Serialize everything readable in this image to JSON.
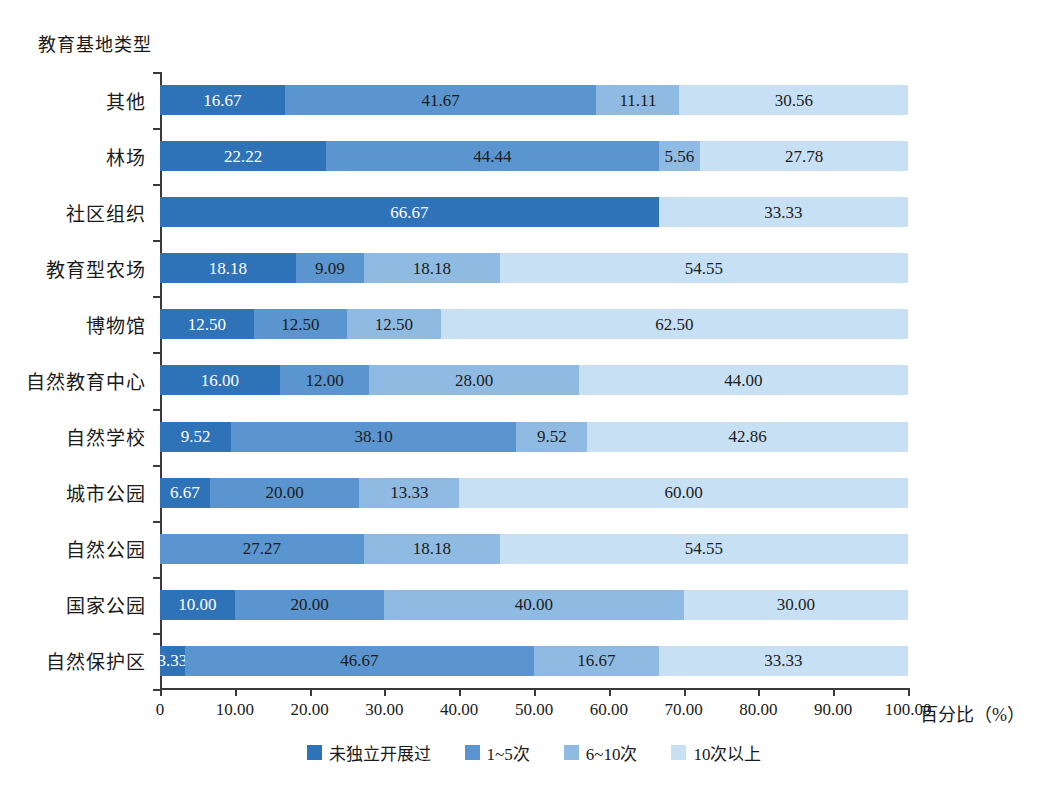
{
  "chart_data": {
    "type": "bar",
    "orientation": "horizontal",
    "stacked": true,
    "normalized": true,
    "title": "",
    "ylabel": "教育基地类型",
    "xlabel": "百分比（%）",
    "xlim": [
      0,
      100
    ],
    "xticks": [
      "0",
      "10.00",
      "20.00",
      "30.00",
      "40.00",
      "50.00",
      "60.00",
      "70.00",
      "80.00",
      "90.00",
      "100.00"
    ],
    "xtick_values": [
      0,
      10,
      20,
      30,
      40,
      50,
      60,
      70,
      80,
      90,
      100
    ],
    "grid": false,
    "legend_position": "bottom",
    "categories": [
      "其他",
      "林场",
      "社区组织",
      "教育型农场",
      "博物馆",
      "自然教育中心",
      "自然学校",
      "城市公园",
      "自然公园",
      "国家公园",
      "自然保护区"
    ],
    "series": [
      {
        "name": "未独立开展过",
        "color": "#2e72b8",
        "values": [
          16.67,
          22.22,
          66.67,
          18.18,
          12.5,
          16.0,
          9.52,
          6.67,
          0,
          10.0,
          3.33
        ],
        "labels": [
          "16.67",
          "22.22",
          "66.67",
          "18.18",
          "12.50",
          "16.00",
          "9.52",
          "6.67",
          "",
          "10.00",
          "3.33"
        ]
      },
      {
        "name": "1~5次",
        "color": "#5a95d0",
        "values": [
          41.67,
          44.44,
          0,
          9.09,
          12.5,
          12.0,
          38.1,
          20.0,
          27.27,
          20.0,
          46.67
        ],
        "labels": [
          "41.67",
          "44.44",
          "",
          "9.09",
          "12.50",
          "12.00",
          "38.10",
          "20.00",
          "27.27",
          "20.00",
          "46.67"
        ]
      },
      {
        "name": "6~10次",
        "color": "#8fbbe3",
        "values": [
          11.11,
          5.56,
          0,
          18.18,
          12.5,
          28.0,
          9.52,
          13.33,
          18.18,
          40.0,
          16.67
        ],
        "labels": [
          "11.11",
          "5.56",
          "",
          "18.18",
          "12.50",
          "28.00",
          "9.52",
          "13.33",
          "18.18",
          "40.00",
          "16.67"
        ]
      },
      {
        "name": "10次以上",
        "color": "#c7e0f4",
        "values": [
          30.56,
          27.78,
          33.33,
          54.55,
          62.5,
          44.0,
          42.86,
          60.0,
          54.55,
          30.0,
          33.33
        ],
        "labels": [
          "30.56",
          "27.78",
          "33.33",
          "54.55",
          "62.50",
          "44.00",
          "42.86",
          "60.00",
          "54.55",
          "30.00",
          "33.33"
        ]
      }
    ]
  },
  "caption": ""
}
